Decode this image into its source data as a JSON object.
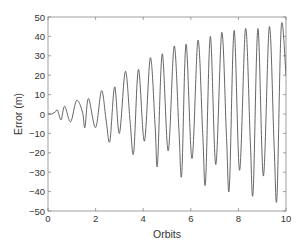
{
  "chart_data": {
    "type": "line",
    "title": "",
    "xlabel": "Orbits",
    "ylabel": "Error (m)",
    "xlim": [
      0,
      10
    ],
    "ylim": [
      -50,
      50
    ],
    "xticks": [
      0,
      2,
      4,
      6,
      8,
      10
    ],
    "yticks": [
      -50,
      -40,
      -30,
      -20,
      -10,
      0,
      10,
      20,
      30,
      40,
      50
    ],
    "grid": false,
    "legend": null,
    "line_color": "#555555",
    "series": [
      {
        "name": "Error",
        "description": "Oscillating error with linearly growing envelope; paired peaks per ~1 orbit",
        "x": [
          0,
          0.15,
          0.3,
          0.4,
          0.55,
          0.7,
          0.95,
          1.2,
          1.45,
          1.55,
          1.7,
          2.0,
          2.25,
          2.45,
          2.6,
          2.8,
          3.0,
          3.25,
          3.45,
          3.6,
          3.8,
          4.05,
          4.3,
          4.5,
          4.6,
          4.8,
          5.05,
          5.3,
          5.5,
          5.62,
          5.8,
          6.05,
          6.3,
          6.5,
          6.62,
          6.82,
          7.05,
          7.3,
          7.5,
          7.62,
          7.82,
          8.05,
          8.3,
          8.5,
          8.62,
          8.82,
          9.05,
          9.3,
          9.5,
          9.62,
          9.8,
          10.0
        ],
        "y": [
          0,
          0,
          1,
          2,
          -3,
          4,
          -4,
          7,
          1,
          -7,
          8,
          -7,
          12,
          -4,
          -14,
          14,
          -10,
          22,
          -4,
          -20,
          23,
          -14,
          29,
          -6,
          -26,
          31,
          -19,
          35,
          -8,
          -31,
          36,
          -23,
          38,
          -10,
          -35,
          40,
          -26,
          42,
          -12,
          -38,
          43,
          -29,
          44,
          -14,
          -40,
          44,
          -32,
          45,
          -16,
          -43,
          45,
          20
        ]
      }
    ]
  }
}
